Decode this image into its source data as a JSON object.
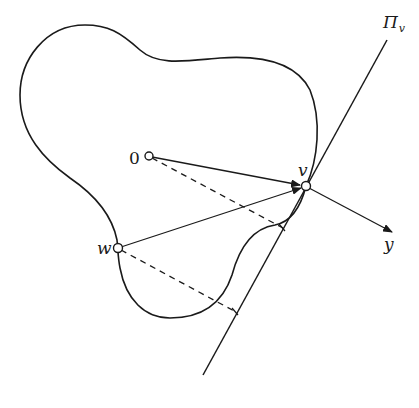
{
  "figure": {
    "labels": {
      "origin": "0",
      "v": "v",
      "w": "w",
      "y": "y",
      "plane_main": "Π",
      "plane_sub": "v"
    },
    "colors": {
      "stroke": "#1a1a1a",
      "background": "#ffffff"
    },
    "points": {
      "origin": [
        149,
        156
      ],
      "v": [
        306,
        186
      ],
      "w": [
        118,
        248
      ]
    },
    "lines": {
      "tangent_plane": {
        "from": [
          387,
          40
        ],
        "to": [
          203,
          375
        ],
        "label": "Π_v"
      },
      "vector_0_to_v": {
        "from": [
          149,
          156
        ],
        "to": [
          306,
          186
        ],
        "style": "solid-arrow"
      },
      "vector_w_to_v": {
        "from": [
          118,
          248
        ],
        "to": [
          306,
          186
        ],
        "style": "solid"
      },
      "vector_y": {
        "from": [
          306,
          186
        ],
        "to": [
          392,
          232
        ],
        "style": "solid-arrow",
        "label": "y"
      },
      "projection_0": {
        "from": [
          149,
          156
        ],
        "to": [
          283,
          228
        ],
        "style": "dashed"
      },
      "projection_w": {
        "from": [
          118,
          248
        ],
        "to": [
          236,
          312
        ],
        "style": "dashed"
      }
    }
  }
}
